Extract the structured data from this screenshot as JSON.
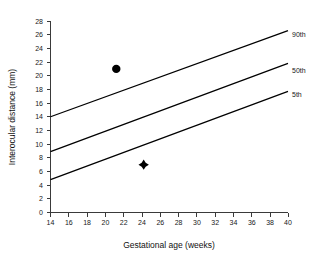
{
  "chart_data": {
    "type": "line",
    "title": "",
    "xlabel": "Gestational age (weeks)",
    "ylabel": "Interocular distance (mm)",
    "xlim": [
      14,
      40
    ],
    "ylim": [
      0,
      28
    ],
    "xticks": [
      14,
      16,
      18,
      20,
      22,
      24,
      26,
      28,
      30,
      32,
      34,
      36,
      38,
      40
    ],
    "yticks": [
      0,
      2,
      4,
      6,
      8,
      10,
      12,
      14,
      16,
      18,
      20,
      22,
      24,
      26,
      28
    ],
    "grid": false,
    "legend_position": "right-inline-labels",
    "series": [
      {
        "name": "90th",
        "label": "90th",
        "x": [
          14,
          40
        ],
        "values": [
          14.0,
          26.6
        ],
        "color": "#000000"
      },
      {
        "name": "50th",
        "label": "50th",
        "x": [
          14,
          40
        ],
        "values": [
          8.9,
          21.8
        ],
        "color": "#000000"
      },
      {
        "name": "5th",
        "label": "5th",
        "x": [
          14,
          40
        ],
        "values": [
          4.8,
          17.7
        ],
        "color": "#000000"
      }
    ],
    "points": [
      {
        "name": "circle-point",
        "marker": "circle",
        "x": 21.2,
        "y": 21.0,
        "color": "#000000"
      },
      {
        "name": "diamond-point",
        "marker": "diamond",
        "x": 24.2,
        "y": 7.0,
        "color": "#000000"
      }
    ],
    "axis_color": "#3a3a3a",
    "background_color": "#ffffff"
  },
  "axes": {
    "x_title": "Gestational age (weeks)",
    "y_title": "Interocular distance (mm)",
    "x_tick_labels": [
      "14",
      "16",
      "18",
      "20",
      "22",
      "24",
      "26",
      "28",
      "30",
      "32",
      "34",
      "36",
      "38",
      "40"
    ],
    "y_tick_labels": [
      "0",
      "2",
      "4",
      "6",
      "8",
      "10",
      "12",
      "14",
      "16",
      "18",
      "20",
      "22",
      "24",
      "26",
      "28"
    ]
  },
  "series_labels": {
    "p90": "90th",
    "p50": "50th",
    "p5": "5th"
  }
}
